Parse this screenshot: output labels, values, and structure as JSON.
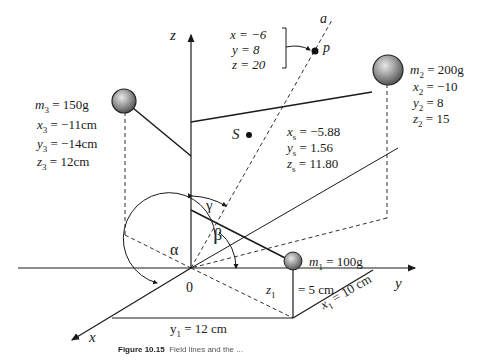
{
  "axes": {
    "x": "x",
    "y": "y",
    "z": "z",
    "a": "a",
    "origin": "0"
  },
  "point_p": {
    "label": "p",
    "x": "x = −6",
    "y": "y = 8",
    "z": "z = 20"
  },
  "mass1": {
    "m": "m",
    "sub": "1",
    "value": " = 100g",
    "z_label": "z",
    "z_sub": "1",
    "z_value": "= 5 cm",
    "x_label": "x",
    "x_sub": "1",
    "x_value": " = 10 cm",
    "y_label": "y",
    "y_sub": "1",
    "y_value": " = 12 cm"
  },
  "mass2": {
    "m": " = 200g",
    "x": " = −10",
    "y": " = 8",
    "z": " = 15",
    "sub": "2"
  },
  "mass3": {
    "m": " = 150g",
    "x": " = −11cm",
    "y": " = −14cm",
    "z": " = 12cm",
    "sub": "3"
  },
  "centroid": {
    "label": "S",
    "x": " = −5.88",
    "y": " = 1.56",
    "z": " = 11.80",
    "sub": "s"
  },
  "angles": {
    "alpha": "α",
    "beta": "β",
    "gamma": "γ"
  },
  "caption": {
    "prefix": "Figure 10.15",
    "text": "Field lines and the ..."
  }
}
